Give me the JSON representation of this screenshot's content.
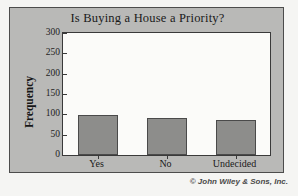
{
  "chart_data": {
    "type": "bar",
    "title": "Is Buying a House a Priority?",
    "xlabel": "",
    "ylabel": "Frequency",
    "categories": [
      "Yes",
      "No",
      "Undecided"
    ],
    "values": [
      98,
      91,
      86
    ],
    "ylim": [
      0,
      300
    ],
    "yticks": [
      0,
      50,
      100,
      150,
      200,
      250,
      300
    ],
    "ytick_labels": [
      "0",
      "50",
      "100",
      "150",
      "200",
      "250",
      "300"
    ],
    "grid": false,
    "legend": null,
    "bar_color": "#8d8d8b",
    "bar_edge_color": "#4a4a4a",
    "plot_background": "#fbfbf9",
    "panel_background": "#b9b9b7",
    "axis_color": "#3a3a3a"
  },
  "credit": "© John Wiley & Sons, Inc."
}
